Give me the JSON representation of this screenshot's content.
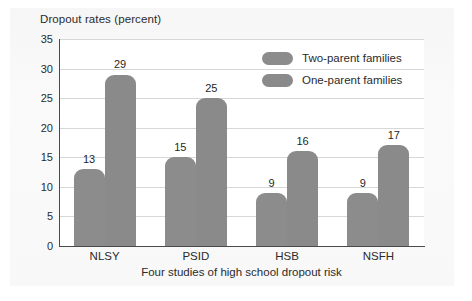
{
  "chart_data": {
    "type": "bar",
    "title": "Dropout rates (percent)",
    "xlabel": "Four studies of high school dropout risk",
    "ylabel": "Dropout rates (percent)",
    "categories": [
      "NLSY",
      "PSID",
      "HSB",
      "NSFH"
    ],
    "series": [
      {
        "name": "Two-parent families",
        "values": [
          13,
          15,
          9,
          9
        ],
        "color": "#8c8c8c"
      },
      {
        "name": "One-parent families",
        "values": [
          29,
          25,
          16,
          17
        ],
        "color": "#8a8a8a"
      }
    ],
    "ylim": [
      0,
      35
    ],
    "yticks": [
      0,
      5,
      10,
      15,
      20,
      25,
      30,
      35
    ],
    "ytick_labels": [
      "0",
      "5",
      "10",
      "15",
      "20",
      "25",
      "30",
      "35"
    ],
    "grid": "horizontal",
    "legend_position": "top-right",
    "data_labels": true,
    "bar_grouping": "adjacent",
    "bar_corner_style": "rounded-top"
  },
  "colors": {
    "bar_fill": "#8c8c8c",
    "gridline": "#d7d7d7",
    "axis": "#4a4a4a",
    "text": "#2b2b2b",
    "plot_background": "#ffffff",
    "figure_background": "#f7f7f7"
  }
}
